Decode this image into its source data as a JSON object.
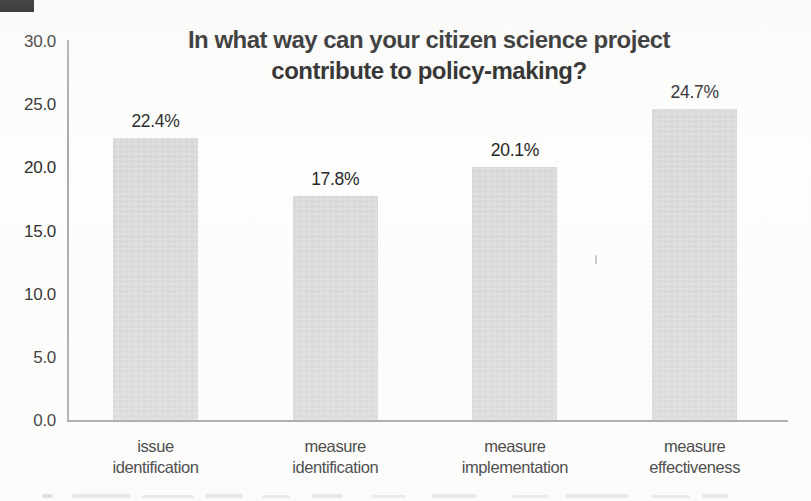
{
  "chart_data": {
    "type": "bar",
    "title": "In what way can your citizen science project contribute to policy-making?",
    "title_lines": [
      "In what way can your citizen science project",
      "contribute to policy-making?"
    ],
    "categories": [
      "issue identification",
      "measure identification",
      "measure implementation",
      "measure effectiveness"
    ],
    "category_lines": [
      [
        "issue",
        "identification"
      ],
      [
        "measure",
        "identification"
      ],
      [
        "measure",
        "implementation"
      ],
      [
        "measure",
        "effectiveness"
      ]
    ],
    "values": [
      22.4,
      17.8,
      20.1,
      24.7
    ],
    "value_labels": [
      "22.4%",
      "17.8%",
      "20.1%",
      "24.7%"
    ],
    "xlabel": "",
    "ylabel": "",
    "y_ticks": [
      "30.0",
      "25.0",
      "20.0",
      "15.0",
      "10.0",
      "5.0",
      "0.0"
    ],
    "ylim": [
      0,
      30
    ],
    "grid": false,
    "legend": "none",
    "bar_color": "#d9d9d9",
    "axis_color": "#a3a3a3",
    "text_color": "#2b2b2b",
    "title_color": "#1b1b1b"
  }
}
